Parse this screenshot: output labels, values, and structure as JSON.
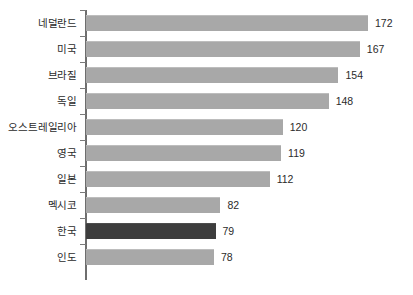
{
  "chart_data": {
    "type": "bar",
    "orientation": "horizontal",
    "title": "",
    "subtitle": "",
    "xlabel": "",
    "ylabel": "",
    "grid": false,
    "legend": null,
    "xlim": [
      0,
      172
    ],
    "categories": [
      "네덜란드",
      "미국",
      "브라질",
      "독일",
      "오스트레일리아",
      "영국",
      "일본",
      "멕시코",
      "한국",
      "인도"
    ],
    "values": [
      172,
      167,
      154,
      148,
      120,
      119,
      112,
      82,
      79,
      78
    ],
    "value_labels": [
      "172",
      "167",
      "154",
      "148",
      "120",
      "119",
      "112",
      "82",
      "79",
      "78"
    ],
    "highlight_index": 8,
    "highlight_category": "한국",
    "colors": {
      "bar": "#a8a8a8",
      "bar_highlight": "#3d3d3d",
      "axis": "#6e6e6e",
      "tick": "#7a7a7a",
      "text": "#2b2b2b",
      "background": "#ffffff"
    }
  }
}
